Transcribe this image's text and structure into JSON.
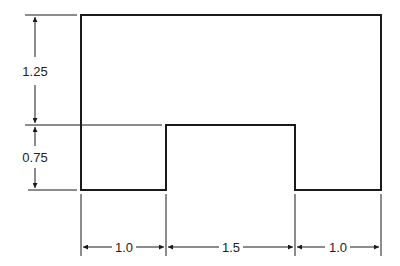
{
  "drawing": {
    "type": "technical-drawing",
    "shape": "rectangle-with-bottom-notch",
    "line_color": "#1a1a1a",
    "dimensions": {
      "vertical_upper": "1.25",
      "vertical_lower": "0.75",
      "horizontal_left": "1.0",
      "horizontal_middle": "1.5",
      "horizontal_right": "1.0"
    }
  }
}
